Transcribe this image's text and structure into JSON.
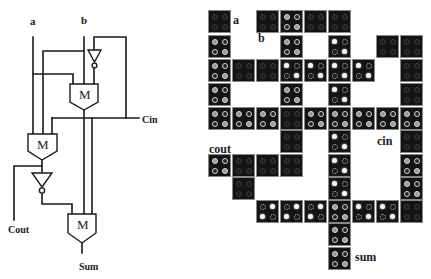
{
  "circuit": {
    "labels": {
      "a": "a",
      "b": "b",
      "cin": "Cin",
      "cout": "Cout",
      "sum": "Sum",
      "majority_gate": "M"
    },
    "gates": [
      {
        "id": "M2",
        "type": "majority",
        "label": "M"
      },
      {
        "id": "M1",
        "type": "majority",
        "label": "M"
      },
      {
        "id": "M3",
        "type": "majority",
        "label": "M"
      },
      {
        "id": "INV1",
        "type": "inverter"
      },
      {
        "id": "INV2",
        "type": "inverter"
      }
    ]
  },
  "layout": {
    "labels": {
      "a": "a",
      "b": "b",
      "cin": "cin",
      "cout": "cout",
      "sum": "sum"
    },
    "legend_states": {
      "dim": "unpolarized / null cell",
      "ring": "polarized cell (ring dots)",
      "bright_p": "polarized cell, dots on main diagonal",
      "bright_n": "polarized cell, dots on anti-diagonal"
    },
    "cells": [
      {
        "row": 0,
        "col": 0,
        "state": "dim"
      },
      {
        "row": 0,
        "col": 2,
        "state": "dim"
      },
      {
        "row": 0,
        "col": 3,
        "state": "ring"
      },
      {
        "row": 0,
        "col": 4,
        "state": "dim"
      },
      {
        "row": 0,
        "col": 5,
        "state": "dim"
      },
      {
        "row": 1,
        "col": 0,
        "state": "ring"
      },
      {
        "row": 1,
        "col": 3,
        "state": "ring"
      },
      {
        "row": 1,
        "col": 5,
        "state": "bright_p"
      },
      {
        "row": 1,
        "col": 7,
        "state": "dim"
      },
      {
        "row": 1,
        "col": 8,
        "state": "dim"
      },
      {
        "row": 2,
        "col": 0,
        "state": "ring"
      },
      {
        "row": 2,
        "col": 1,
        "state": "dim"
      },
      {
        "row": 2,
        "col": 2,
        "state": "dim"
      },
      {
        "row": 2,
        "col": 3,
        "state": "bright_p"
      },
      {
        "row": 2,
        "col": 4,
        "state": "bright_p"
      },
      {
        "row": 2,
        "col": 5,
        "state": "bright_p"
      },
      {
        "row": 2,
        "col": 6,
        "state": "bright_p"
      },
      {
        "row": 2,
        "col": 8,
        "state": "dim"
      },
      {
        "row": 3,
        "col": 0,
        "state": "ring"
      },
      {
        "row": 3,
        "col": 3,
        "state": "ring"
      },
      {
        "row": 3,
        "col": 5,
        "state": "bright_p"
      },
      {
        "row": 3,
        "col": 8,
        "state": "dim"
      },
      {
        "row": 4,
        "col": 0,
        "state": "ring"
      },
      {
        "row": 4,
        "col": 1,
        "state": "ring"
      },
      {
        "row": 4,
        "col": 2,
        "state": "ring"
      },
      {
        "row": 4,
        "col": 3,
        "state": "dim"
      },
      {
        "row": 4,
        "col": 4,
        "state": "ring"
      },
      {
        "row": 4,
        "col": 5,
        "state": "ring"
      },
      {
        "row": 4,
        "col": 6,
        "state": "ring"
      },
      {
        "row": 4,
        "col": 7,
        "state": "ring"
      },
      {
        "row": 4,
        "col": 8,
        "state": "ring"
      },
      {
        "row": 5,
        "col": 3,
        "state": "dim"
      },
      {
        "row": 5,
        "col": 5,
        "state": "bright_p"
      },
      {
        "row": 5,
        "col": 8,
        "state": "dim"
      },
      {
        "row": 6,
        "col": 0,
        "state": "ring"
      },
      {
        "row": 6,
        "col": 1,
        "state": "dim"
      },
      {
        "row": 6,
        "col": 2,
        "state": "dim"
      },
      {
        "row": 6,
        "col": 3,
        "state": "dim"
      },
      {
        "row": 6,
        "col": 5,
        "state": "bright_p"
      },
      {
        "row": 6,
        "col": 8,
        "state": "ring"
      },
      {
        "row": 7,
        "col": 1,
        "state": "dim"
      },
      {
        "row": 7,
        "col": 5,
        "state": "bright_p"
      },
      {
        "row": 7,
        "col": 8,
        "state": "ring"
      },
      {
        "row": 8,
        "col": 2,
        "state": "bright_n"
      },
      {
        "row": 8,
        "col": 3,
        "state": "bright_n"
      },
      {
        "row": 8,
        "col": 4,
        "state": "bright_n"
      },
      {
        "row": 8,
        "col": 5,
        "state": "ring"
      },
      {
        "row": 8,
        "col": 6,
        "state": "bright_p"
      },
      {
        "row": 8,
        "col": 7,
        "state": "bright_p"
      },
      {
        "row": 8,
        "col": 8,
        "state": "dim"
      },
      {
        "row": 9,
        "col": 5,
        "state": "ring"
      },
      {
        "row": 10,
        "col": 5,
        "state": "ring"
      }
    ]
  }
}
